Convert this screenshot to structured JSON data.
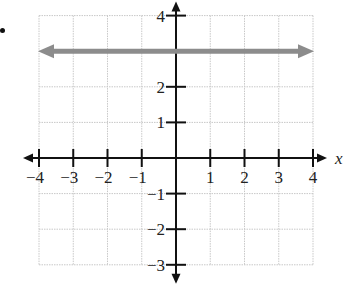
{
  "chart_data": {
    "type": "line",
    "title": "",
    "xlabel": "x",
    "ylabel": "",
    "xlim": [
      -4,
      4
    ],
    "ylim": [
      -3,
      4
    ],
    "grid": true,
    "x_ticks": [
      -4,
      -3,
      -2,
      -1,
      1,
      2,
      3,
      4
    ],
    "y_ticks": [
      -3,
      -2,
      -1,
      1,
      2,
      4
    ],
    "x_tick_labels": [
      "−4",
      "−3",
      "−2",
      "−1",
      "1",
      "2",
      "3",
      "4"
    ],
    "y_tick_labels": [
      "−3",
      "−2",
      "−1",
      "1",
      "2",
      "4"
    ],
    "series": [
      {
        "name": "y = 3",
        "kind": "horizontal line with arrows",
        "x": [
          -4,
          4
        ],
        "y": [
          3,
          3
        ],
        "color": "#8c8c8c"
      }
    ]
  },
  "colors": {
    "axis": "#111111",
    "grid": "#c8c8c8",
    "line": "#8c8c8c"
  },
  "labels": {
    "x_axis": "x"
  }
}
